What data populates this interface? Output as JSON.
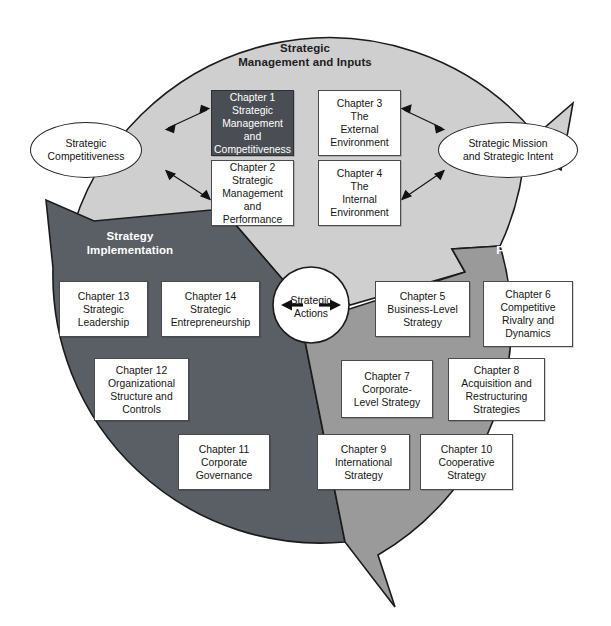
{
  "diagram": {
    "colors": {
      "inputs_region": "#cfcfcf",
      "implementation_region": "#5a5f66",
      "formulation_region": "#9a9a9a",
      "chapter_box_fill": "#ffffff",
      "chapter_box_highlight_fill": "#4a4e54",
      "outline": "#1b1b1b",
      "center_fill": "#ffffff"
    }
  },
  "regions": {
    "inputs": {
      "label": "Strategic\nManagement and Inputs"
    },
    "implementation": {
      "label": "Strategy\nImplementation"
    },
    "formulation": {
      "label": "Strategy\nFormulation"
    }
  },
  "center": {
    "label": "Strategic\nActions"
  },
  "ovals": [
    {
      "name": "strategic-competitiveness",
      "label": "Strategic\nCompetitiveness"
    },
    {
      "name": "strategic-mission-and-intent",
      "label": "Strategic Mission\nand Strategic Intent"
    }
  ],
  "chapters": {
    "inputs": [
      {
        "id": 1,
        "label": "Chapter 1\nStrategic\nManagement and\nCompetitiveness",
        "highlight": true
      },
      {
        "id": 3,
        "label": "Chapter 3\nThe\nExternal\nEnvironment",
        "highlight": false
      },
      {
        "id": 2,
        "label": "Chapter 2\nStrategic\nManagement and\nPerformance",
        "highlight": false
      },
      {
        "id": 4,
        "label": "Chapter 4\nThe\nInternal\nEnvironment",
        "highlight": false
      }
    ],
    "formulation": [
      {
        "id": 5,
        "label": "Chapter 5\nBusiness-Level\nStrategy"
      },
      {
        "id": 6,
        "label": "Chapter 6\nCompetitive\nRivalry and\nDynamics"
      },
      {
        "id": 7,
        "label": "Chapter 7\nCorporate-\nLevel Strategy"
      },
      {
        "id": 8,
        "label": "Chapter 8\nAcquisition and\nRestructuring\nStrategies"
      },
      {
        "id": 9,
        "label": "Chapter 9\nInternational\nStrategy"
      },
      {
        "id": 10,
        "label": "Chapter 10\nCooperative\nStrategy"
      }
    ],
    "implementation": [
      {
        "id": 13,
        "label": "Chapter 13\nStrategic\nLeadership"
      },
      {
        "id": 14,
        "label": "Chapter 14\nStrategic\nEntrepreneurship"
      },
      {
        "id": 12,
        "label": "Chapter 12\nOrganizational\nStructure and\nControls"
      },
      {
        "id": 11,
        "label": "Chapter 11\nCorporate\nGovernance"
      }
    ]
  }
}
